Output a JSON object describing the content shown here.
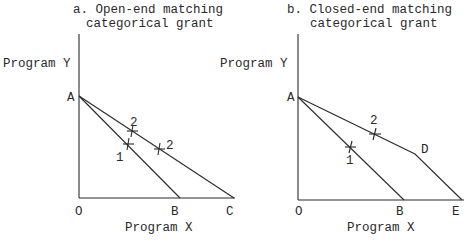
{
  "panels": [
    {
      "title_line1": "a. Open-end matching",
      "title_line2": "categorical  grant",
      "y_label": "Program Y",
      "x_label": "Program X",
      "points": {
        "A": "A",
        "O": "O",
        "B": "B",
        "C": "C"
      },
      "markers": [
        "2",
        "1",
        "2"
      ]
    },
    {
      "title_line1": "b. Closed-end matching",
      "title_line2": "categorical grant",
      "y_label": "Program Y",
      "x_label": "Program X",
      "points": {
        "A": "A",
        "O": "O",
        "B": "B",
        "D": "D",
        "E": "E"
      },
      "markers": [
        "2",
        "1"
      ]
    }
  ]
}
